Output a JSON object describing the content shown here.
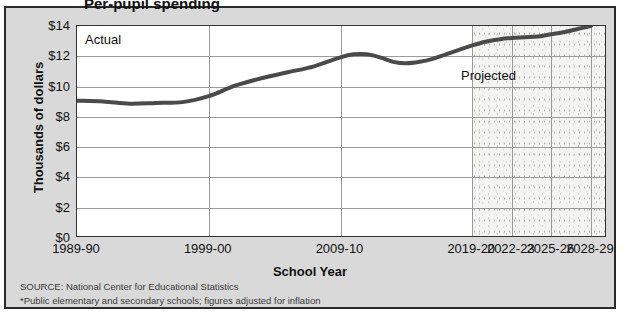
{
  "figure": {
    "title_cut": "Per-pupil spending",
    "panel_bg": "#d9d9d9",
    "plot_bg": "#ffffff",
    "line_color": "#4a4a4a",
    "grid_color": "#9a9a9a"
  },
  "axis": {
    "ylabel": "Thousands of dollars",
    "xlabel": "School Year",
    "yticks": [
      "$0",
      "$2",
      "$4",
      "$6",
      "$8",
      "$10",
      "$12",
      "$14"
    ],
    "xticks": [
      "1989-90",
      "1999-00",
      "2009-10",
      "2019-20",
      "2022-23",
      "2025-26",
      "2028-29"
    ]
  },
  "bands": {
    "actual_label": "Actual",
    "projected_label": "Projected"
  },
  "notes": {
    "source": "SOURCE: National Center for Educational Statistics",
    "footnote": "*Public elementary and secondary schools; figures adjusted for inflation"
  },
  "chart_data": {
    "type": "line",
    "title": "Per-pupil spending",
    "xlabel": "School Year",
    "ylabel": "Thousands of dollars",
    "ylim": [
      0,
      14
    ],
    "ytick_values": [
      0,
      2,
      4,
      6,
      8,
      10,
      12,
      14
    ],
    "xtick_labels": [
      "1989-90",
      "1999-00",
      "2009-10",
      "2019-20",
      "2022-23",
      "2025-26",
      "2028-29"
    ],
    "xtick_positions": [
      1989,
      1999,
      2009,
      2019,
      2022,
      2025,
      2028
    ],
    "xlim": [
      1989,
      2029
    ],
    "grid": true,
    "legend_position": "none",
    "annotations": [
      {
        "text": "Actual",
        "x_range": [
          1989,
          2019
        ]
      },
      {
        "text": "Projected",
        "x_range": [
          2019,
          2029
        ]
      }
    ],
    "projection_start_year": 2019,
    "series": [
      {
        "name": "Per-pupil spending (thousands of dollars)",
        "color": "#4a4a4a",
        "x": [
          1989,
          1991,
          1993,
          1995,
          1997,
          1999,
          2001,
          2003,
          2005,
          2007,
          2009,
          2010,
          2011,
          2012,
          2013,
          2014,
          2015,
          2016,
          2017,
          2018,
          2019,
          2020,
          2021,
          2022,
          2023,
          2024,
          2025,
          2026,
          2027,
          2028
        ],
        "y": [
          9.0,
          8.95,
          8.8,
          8.85,
          8.9,
          9.3,
          10.0,
          10.5,
          10.9,
          11.3,
          11.9,
          12.1,
          12.1,
          11.9,
          11.6,
          11.5,
          11.6,
          11.8,
          12.1,
          12.4,
          12.7,
          12.95,
          13.1,
          13.2,
          13.25,
          13.3,
          13.45,
          13.6,
          13.8,
          14.0
        ]
      }
    ]
  }
}
